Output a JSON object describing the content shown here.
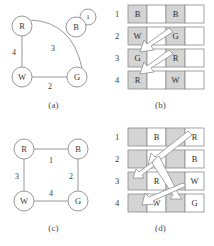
{
  "figure": {
    "panels": [
      {
        "id": "a",
        "caption": "(a)",
        "type": "graph",
        "nodes": [
          {
            "id": "R",
            "label": "R",
            "x": 22,
            "y": 26
          },
          {
            "id": "B",
            "label": "B",
            "x": 76,
            "y": 27
          },
          {
            "id": "W",
            "label": "W",
            "x": 22,
            "y": 77
          },
          {
            "id": "G",
            "label": "G",
            "x": 77,
            "y": 77
          }
        ],
        "badge": {
          "label": "1",
          "x": 88,
          "y": 17
        },
        "edges": [
          {
            "from": "R",
            "to": "G",
            "weight": "3",
            "curved": true,
            "wx": 53,
            "wy": 48
          },
          {
            "from": "R",
            "to": "W",
            "weight": "4",
            "curved": false,
            "wx": 14,
            "wy": 52
          },
          {
            "from": "W",
            "to": "G",
            "weight": "2",
            "curved": false,
            "wx": 50,
            "wy": 85
          }
        ]
      },
      {
        "id": "c",
        "caption": "(c)",
        "type": "graph",
        "nodes": [
          {
            "id": "R",
            "label": "R",
            "x": 24,
            "y": 26
          },
          {
            "id": "B",
            "label": "B",
            "x": 78,
            "y": 26
          },
          {
            "id": "W",
            "label": "W",
            "x": 24,
            "y": 78
          },
          {
            "id": "G",
            "label": "G",
            "x": 78,
            "y": 78
          }
        ],
        "badge": null,
        "edges": [
          {
            "from": "R",
            "to": "B",
            "weight": "1",
            "curved": false,
            "wx": 51,
            "wy": 36
          },
          {
            "from": "R",
            "to": "W",
            "weight": "3",
            "curved": false,
            "wx": 17,
            "wy": 53
          },
          {
            "from": "B",
            "to": "G",
            "weight": "2",
            "curved": false,
            "wx": 71,
            "wy": 53
          },
          {
            "from": "W",
            "to": "G",
            "weight": "4",
            "curved": false,
            "wx": 51,
            "wy": 70
          }
        ]
      },
      {
        "id": "b",
        "caption": "(b)",
        "type": "grid",
        "rows": [
          {
            "number": "1",
            "cells": [
              {
                "label": "B",
                "shaded": true
              },
              {
                "label": "",
                "shaded": false
              },
              {
                "label": "B",
                "shaded": true
              },
              {
                "label": "",
                "shaded": false
              }
            ]
          },
          {
            "number": "2",
            "cells": [
              {
                "label": "W",
                "shaded": true
              },
              {
                "label": "",
                "shaded": false
              },
              {
                "label": "G",
                "shaded": true
              },
              {
                "label": "",
                "shaded": false
              }
            ]
          },
          {
            "number": "3",
            "cells": [
              {
                "label": "G",
                "shaded": true
              },
              {
                "label": "",
                "shaded": false
              },
              {
                "label": "R",
                "shaded": true
              },
              {
                "label": "",
                "shaded": false
              }
            ]
          },
          {
            "number": "4",
            "cells": [
              {
                "label": "R",
                "shaded": true
              },
              {
                "label": "",
                "shaded": false
              },
              {
                "label": "W",
                "shaded": true
              },
              {
                "label": "",
                "shaded": false
              }
            ]
          }
        ],
        "arrows": [
          {
            "name": "arrow-row2-G-to-row3-G",
            "x1": 57,
            "y1": 34,
            "x2": 29,
            "y2": 50
          },
          {
            "name": "arrow-row3-R-to-row4-R",
            "x1": 57,
            "y1": 56,
            "x2": 29,
            "y2": 72
          }
        ]
      },
      {
        "id": "d",
        "caption": "(d)",
        "type": "grid",
        "rows": [
          {
            "number": "1",
            "cells": [
              {
                "label": "",
                "shaded": true
              },
              {
                "label": "B",
                "shaded": false
              },
              {
                "label": "",
                "shaded": true
              },
              {
                "label": "R",
                "shaded": false
              }
            ]
          },
          {
            "number": "2",
            "cells": [
              {
                "label": "",
                "shaded": true
              },
              {
                "label": "G",
                "shaded": false
              },
              {
                "label": "",
                "shaded": true
              },
              {
                "label": "B",
                "shaded": false
              }
            ]
          },
          {
            "number": "3",
            "cells": [
              {
                "label": "",
                "shaded": true
              },
              {
                "label": "R",
                "shaded": false
              },
              {
                "label": "",
                "shaded": true
              },
              {
                "label": "W",
                "shaded": false
              }
            ]
          },
          {
            "number": "4",
            "cells": [
              {
                "label": "",
                "shaded": true
              },
              {
                "label": "W",
                "shaded": false
              },
              {
                "label": "",
                "shaded": true
              },
              {
                "label": "G",
                "shaded": false
              }
            ]
          }
        ],
        "arrows": [
          {
            "name": "arrow-row1-R-to-row2-G",
            "x1": 72,
            "y1": 12,
            "x2": 40,
            "y2": 34
          },
          {
            "name": "arrow-row2-G-to-row3-R",
            "x1": 42,
            "y1": 36,
            "x2": 22,
            "y2": 52
          },
          {
            "name": "arrow-row3-W-to-row4-W",
            "x1": 68,
            "y1": 58,
            "x2": 34,
            "y2": 76
          },
          {
            "name": "arrow-branch-down",
            "x1": 40,
            "y1": 34,
            "x2": 63,
            "y2": 72
          }
        ]
      }
    ]
  }
}
